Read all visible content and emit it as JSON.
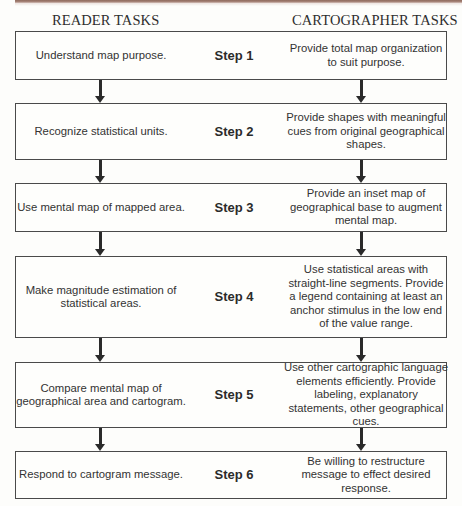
{
  "header": {
    "reader_title": "READER TASKS",
    "cartographer_title": "CARTOGRAPHER TASKS"
  },
  "steps": [
    {
      "label": "Step 1",
      "reader": "Understand map purpose.",
      "cartographer": "Provide total map organization to suit purpose."
    },
    {
      "label": "Step 2",
      "reader": "Recognize statistical units.",
      "cartographer": "Provide shapes with meaningful cues from original geographical shapes."
    },
    {
      "label": "Step 3",
      "reader": "Use mental map of mapped area.",
      "cartographer": "Provide an inset map of geographical base to augment mental map."
    },
    {
      "label": "Step 4",
      "reader": "Make magnitude estimation of statistical areas.",
      "cartographer": "Use statistical areas with straight-line segments. Provide a legend containing at least an anchor stimulus in the low end of the value range."
    },
    {
      "label": "Step 5",
      "reader": "Compare mental map of geographical area and cartogram.",
      "cartographer": "Use other cartographic language elements efficiently. Provide labeling, explanatory statements, other geographical cues."
    },
    {
      "label": "Step 6",
      "reader": "Respond to cartogram message.",
      "cartographer": "Be willing to restructure message to effect desired response."
    }
  ],
  "colors": {
    "border": "#4a4a4a",
    "arrow": "#2a2a2a",
    "top_band": "#8f6a5c",
    "background": "#fdfdfb"
  }
}
